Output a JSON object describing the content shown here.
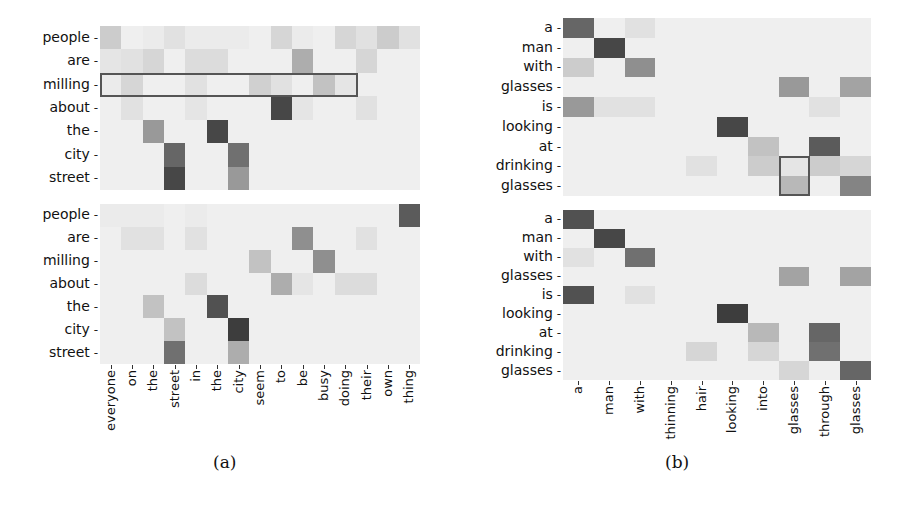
{
  "captions": {
    "a": "(a)",
    "b": "(b)"
  },
  "chart_data": [
    {
      "type": "heatmap",
      "panel": "a-top",
      "rows": [
        "people",
        "are",
        "milling",
        "about",
        "the",
        "city",
        "street"
      ],
      "cols": [
        "everyone",
        "on",
        "the",
        "street",
        "in",
        "the",
        "city",
        "seem",
        "to",
        "be",
        "busy",
        "doing",
        "their",
        "own",
        "thing"
      ],
      "highlight": {
        "row": 2,
        "col_start": 0,
        "col_end": 11
      },
      "values": [
        [
          0.2,
          0.03,
          0.05,
          0.1,
          0.05,
          0.05,
          0.05,
          0.03,
          0.15,
          0.05,
          0.03,
          0.15,
          0.1,
          0.2,
          0.1
        ],
        [
          0.08,
          0.1,
          0.15,
          0.03,
          0.12,
          0.12,
          0.03,
          0.03,
          0.03,
          0.35,
          0.03,
          0.03,
          0.15,
          0.03,
          0.03
        ],
        [
          0.05,
          0.15,
          0.03,
          0.03,
          0.1,
          0.03,
          0.03,
          0.18,
          0.1,
          0.03,
          0.25,
          0.08,
          0.03,
          0.03,
          0.03
        ],
        [
          0.03,
          0.1,
          0.03,
          0.03,
          0.08,
          0.03,
          0.03,
          0.03,
          0.85,
          0.08,
          0.03,
          0.03,
          0.1,
          0.03,
          0.03
        ],
        [
          0.03,
          0.03,
          0.45,
          0.03,
          0.03,
          0.85,
          0.03,
          0.03,
          0.03,
          0.03,
          0.03,
          0.03,
          0.03,
          0.03,
          0.03
        ],
        [
          0.03,
          0.03,
          0.03,
          0.7,
          0.03,
          0.03,
          0.65,
          0.03,
          0.03,
          0.03,
          0.03,
          0.03,
          0.03,
          0.03,
          0.03
        ],
        [
          0.03,
          0.03,
          0.03,
          0.85,
          0.03,
          0.03,
          0.45,
          0.03,
          0.03,
          0.03,
          0.03,
          0.03,
          0.03,
          0.03,
          0.03
        ]
      ]
    },
    {
      "type": "heatmap",
      "panel": "a-bottom",
      "rows": [
        "people",
        "are",
        "milling",
        "about",
        "the",
        "city",
        "street"
      ],
      "cols": [
        "everyone",
        "on",
        "the",
        "street",
        "in",
        "the",
        "city",
        "seem",
        "to",
        "be",
        "busy",
        "doing",
        "their",
        "own",
        "thing"
      ],
      "values": [
        [
          0.05,
          0.05,
          0.05,
          0.03,
          0.05,
          0.03,
          0.03,
          0.03,
          0.03,
          0.03,
          0.03,
          0.03,
          0.03,
          0.03,
          0.75
        ],
        [
          0.03,
          0.1,
          0.1,
          0.03,
          0.1,
          0.03,
          0.03,
          0.03,
          0.03,
          0.5,
          0.03,
          0.03,
          0.1,
          0.03,
          0.03
        ],
        [
          0.03,
          0.03,
          0.03,
          0.03,
          0.03,
          0.03,
          0.03,
          0.25,
          0.03,
          0.03,
          0.5,
          0.03,
          0.03,
          0.03,
          0.03
        ],
        [
          0.03,
          0.03,
          0.03,
          0.03,
          0.12,
          0.03,
          0.03,
          0.03,
          0.35,
          0.08,
          0.03,
          0.12,
          0.12,
          0.03,
          0.03
        ],
        [
          0.03,
          0.03,
          0.25,
          0.03,
          0.03,
          0.8,
          0.03,
          0.03,
          0.03,
          0.03,
          0.03,
          0.03,
          0.03,
          0.03,
          0.03
        ],
        [
          0.03,
          0.03,
          0.03,
          0.25,
          0.03,
          0.03,
          0.9,
          0.03,
          0.03,
          0.03,
          0.03,
          0.03,
          0.03,
          0.03,
          0.03
        ],
        [
          0.03,
          0.03,
          0.03,
          0.65,
          0.03,
          0.03,
          0.35,
          0.03,
          0.03,
          0.03,
          0.03,
          0.03,
          0.03,
          0.03,
          0.03
        ]
      ]
    },
    {
      "type": "heatmap",
      "panel": "b-top",
      "rows": [
        "a",
        "man",
        "with",
        "glasses",
        "is",
        "looking",
        "at",
        "drinking",
        "glasses"
      ],
      "cols": [
        "a",
        "man",
        "with",
        "thinning",
        "hair",
        "looking",
        "into",
        "glasses",
        "through",
        "glasses"
      ],
      "highlight": {
        "row_start": 7,
        "row_end": 8,
        "col": 7
      },
      "values": [
        [
          0.7,
          0.03,
          0.1,
          0.03,
          0.03,
          0.03,
          0.03,
          0.03,
          0.03,
          0.03
        ],
        [
          0.03,
          0.85,
          0.03,
          0.03,
          0.03,
          0.03,
          0.03,
          0.03,
          0.03,
          0.03
        ],
        [
          0.2,
          0.03,
          0.5,
          0.03,
          0.03,
          0.03,
          0.03,
          0.03,
          0.03,
          0.03
        ],
        [
          0.03,
          0.03,
          0.03,
          0.03,
          0.03,
          0.03,
          0.03,
          0.45,
          0.03,
          0.4
        ],
        [
          0.45,
          0.1,
          0.1,
          0.03,
          0.03,
          0.03,
          0.03,
          0.03,
          0.1,
          0.03
        ],
        [
          0.03,
          0.03,
          0.03,
          0.03,
          0.03,
          0.85,
          0.03,
          0.03,
          0.03,
          0.03
        ],
        [
          0.03,
          0.03,
          0.03,
          0.03,
          0.03,
          0.03,
          0.25,
          0.03,
          0.75,
          0.03
        ],
        [
          0.03,
          0.03,
          0.03,
          0.03,
          0.1,
          0.03,
          0.2,
          0.08,
          0.2,
          0.15
        ],
        [
          0.03,
          0.03,
          0.03,
          0.03,
          0.03,
          0.03,
          0.03,
          0.3,
          0.03,
          0.55
        ]
      ]
    },
    {
      "type": "heatmap",
      "panel": "b-bottom",
      "rows": [
        "a",
        "man",
        "with",
        "glasses",
        "is",
        "looking",
        "at",
        "drinking",
        "glasses"
      ],
      "cols": [
        "a",
        "man",
        "with",
        "thinning",
        "hair",
        "looking",
        "into",
        "glasses",
        "through",
        "glasses"
      ],
      "values": [
        [
          0.8,
          0.03,
          0.03,
          0.03,
          0.03,
          0.03,
          0.03,
          0.03,
          0.03,
          0.03
        ],
        [
          0.03,
          0.85,
          0.03,
          0.03,
          0.03,
          0.03,
          0.03,
          0.03,
          0.03,
          0.03
        ],
        [
          0.1,
          0.03,
          0.65,
          0.03,
          0.03,
          0.03,
          0.03,
          0.03,
          0.03,
          0.03
        ],
        [
          0.03,
          0.03,
          0.03,
          0.03,
          0.03,
          0.03,
          0.03,
          0.4,
          0.03,
          0.4
        ],
        [
          0.8,
          0.03,
          0.1,
          0.03,
          0.03,
          0.03,
          0.03,
          0.03,
          0.03,
          0.03
        ],
        [
          0.03,
          0.03,
          0.03,
          0.03,
          0.03,
          0.9,
          0.03,
          0.03,
          0.03,
          0.03
        ],
        [
          0.03,
          0.03,
          0.03,
          0.03,
          0.03,
          0.03,
          0.3,
          0.03,
          0.7,
          0.03
        ],
        [
          0.03,
          0.03,
          0.03,
          0.03,
          0.15,
          0.03,
          0.15,
          0.03,
          0.65,
          0.03
        ],
        [
          0.03,
          0.03,
          0.03,
          0.03,
          0.03,
          0.03,
          0.03,
          0.15,
          0.03,
          0.7
        ]
      ]
    }
  ]
}
